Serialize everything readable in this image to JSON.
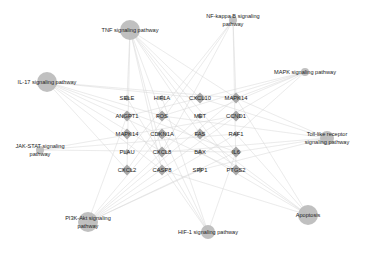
{
  "chart_data": {
    "type": "network",
    "title": "",
    "pathways": [
      {
        "id": "tnf",
        "label": [
          "TNF signaling pathway"
        ],
        "size": "large"
      },
      {
        "id": "nfkb",
        "label": [
          "NF-kappa B signaling",
          "pathway"
        ],
        "size": "small"
      },
      {
        "id": "il17",
        "label": [
          "IL-17 signaling pathway"
        ],
        "size": "large"
      },
      {
        "id": "mapk",
        "label": [
          "MAPK signaling pathway"
        ],
        "size": "small"
      },
      {
        "id": "jakstat",
        "label": [
          "JAK-STAT signaling",
          "pathway"
        ],
        "size": "small"
      },
      {
        "id": "toll",
        "label": [
          "Toll-like receptor",
          "signaling pathway"
        ],
        "size": "medium"
      },
      {
        "id": "pi3k",
        "label": [
          "PI3K-Akt signaling",
          "pathway"
        ],
        "size": "large"
      },
      {
        "id": "apoptosis",
        "label": [
          "Apoptosis"
        ],
        "size": "large"
      },
      {
        "id": "hif1",
        "label": [
          "HIF-1 signaling pathway"
        ],
        "size": "medium"
      }
    ],
    "genes": [
      [
        "SELE",
        "HIF1A",
        "CXCL10",
        "MAPK14"
      ],
      [
        "ANGPT1",
        "FOS",
        "MET",
        "CCND1"
      ],
      [
        "MAPK14",
        "CDKN1A",
        "FAS",
        "RAF1"
      ],
      [
        "PLAU",
        "CXCL8",
        "BAX",
        "IL6"
      ],
      [
        "CXCL2",
        "CASP8",
        "SPP1",
        "PTGS2"
      ]
    ],
    "edges": [
      [
        "tnf",
        "SELE"
      ],
      [
        "tnf",
        "FOS"
      ],
      [
        "tnf",
        "CXCL10"
      ],
      [
        "tnf",
        "MAPK14"
      ],
      [
        "tnf",
        "CXCL8"
      ],
      [
        "tnf",
        "CASP8"
      ],
      [
        "tnf",
        "IL6"
      ],
      [
        "tnf",
        "PTGS2"
      ],
      [
        "tnf",
        "CXCL2"
      ],
      [
        "tnf",
        "FAS"
      ],
      [
        "nfkb",
        "MAPK14"
      ],
      [
        "nfkb",
        "CXCL8"
      ],
      [
        "nfkb",
        "PTGS2"
      ],
      [
        "nfkb",
        "CXCL2"
      ],
      [
        "nfkb",
        "PLAU"
      ],
      [
        "il17",
        "FOS"
      ],
      [
        "il17",
        "CXCL10"
      ],
      [
        "il17",
        "MAPK14"
      ],
      [
        "il17",
        "CXCL8"
      ],
      [
        "il17",
        "CASP8"
      ],
      [
        "il17",
        "IL6"
      ],
      [
        "il17",
        "PTGS2"
      ],
      [
        "il17",
        "CXCL2"
      ],
      [
        "mapk",
        "FOS"
      ],
      [
        "mapk",
        "MAPK14"
      ],
      [
        "mapk",
        "FAS"
      ],
      [
        "mapk",
        "RAF1"
      ],
      [
        "mapk",
        "MET"
      ],
      [
        "mapk",
        "ANGPT1"
      ],
      [
        "jakstat",
        "IL6"
      ],
      [
        "jakstat",
        "CCND1"
      ],
      [
        "jakstat",
        "RAF1"
      ],
      [
        "toll",
        "FOS"
      ],
      [
        "toll",
        "CXCL10"
      ],
      [
        "toll",
        "MAPK14"
      ],
      [
        "toll",
        "CXCL8"
      ],
      [
        "toll",
        "IL6"
      ],
      [
        "toll",
        "SPP1"
      ],
      [
        "pi3k",
        "ANGPT1"
      ],
      [
        "pi3k",
        "MET"
      ],
      [
        "pi3k",
        "CCND1"
      ],
      [
        "pi3k",
        "CDKN1A"
      ],
      [
        "pi3k",
        "RAF1"
      ],
      [
        "pi3k",
        "IL6"
      ],
      [
        "pi3k",
        "SPP1"
      ],
      [
        "pi3k",
        "MAPK14"
      ],
      [
        "apoptosis",
        "FOS"
      ],
      [
        "apoptosis",
        "FAS"
      ],
      [
        "apoptosis",
        "BAX"
      ],
      [
        "apoptosis",
        "CASP8"
      ],
      [
        "apoptosis",
        "RAF1"
      ],
      [
        "apoptosis",
        "MAPK14"
      ],
      [
        "hif1",
        "HIF1A"
      ],
      [
        "hif1",
        "ANGPT1"
      ],
      [
        "hif1",
        "CDKN1A"
      ],
      [
        "hif1",
        "IL6"
      ],
      [
        "hif1",
        "SELE"
      ]
    ]
  }
}
